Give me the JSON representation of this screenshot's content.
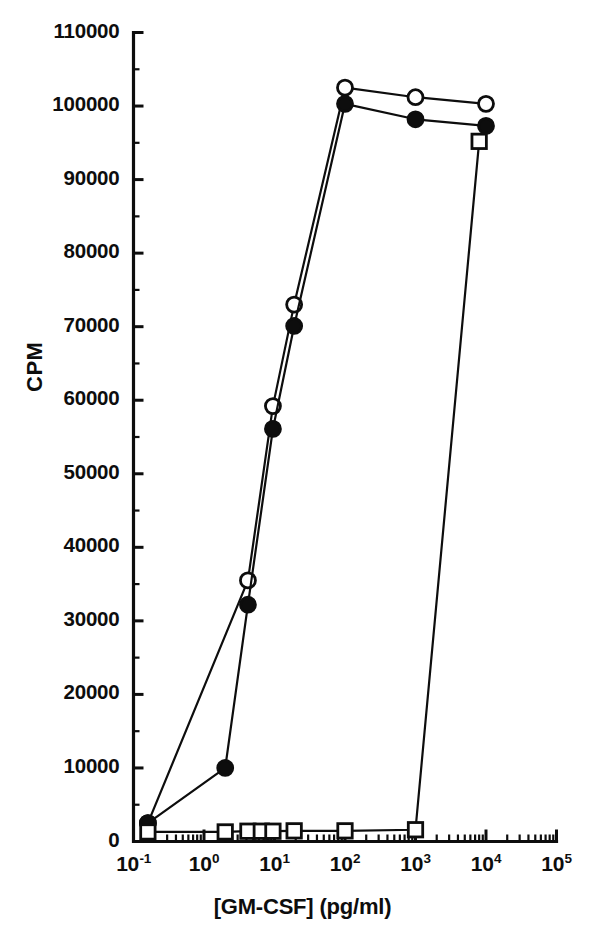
{
  "chart_data": {
    "type": "line",
    "title": "",
    "subtitle": "",
    "xlabel": "[GM-CSF] (pg/ml)",
    "ylabel": "CPM",
    "x_scale": "log",
    "y_scale": "linear",
    "xlim": [
      0.1,
      100000
    ],
    "ylim": [
      0,
      110000
    ],
    "grid": false,
    "legend": "none",
    "x_tick_labels": [
      "10-1",
      "100",
      "101",
      "102",
      "103",
      "104",
      "105"
    ],
    "x_tick_mantissa": [
      "10",
      "10",
      "10",
      "10",
      "10",
      "10",
      "10"
    ],
    "x_tick_exponents": [
      "-1",
      "0",
      "1",
      "2",
      "3",
      "4",
      "5"
    ],
    "x_tick_values": [
      0.1,
      1,
      10,
      100,
      1000,
      10000,
      100000
    ],
    "y_tick_labels": [
      "0",
      "10000",
      "20000",
      "30000",
      "40000",
      "50000",
      "60000",
      "70000",
      "80000",
      "90000",
      "100000",
      "110000"
    ],
    "y_tick_values": [
      0,
      10000,
      20000,
      30000,
      40000,
      50000,
      60000,
      70000,
      80000,
      90000,
      100000,
      110000
    ],
    "y_minor_step": 5000,
    "series": [
      {
        "name": "open-circle-series",
        "marker": "open-circle",
        "color": "#0d0d0d",
        "x": [
          0.16,
          4.2,
          9.5,
          19,
          100,
          1000,
          10000
        ],
        "y": [
          2500,
          35500,
          59200,
          73000,
          102500,
          101200,
          100300
        ]
      },
      {
        "name": "filled-circle-series",
        "marker": "filled-circle",
        "color": "#0d0d0d",
        "x": [
          0.16,
          2.0,
          4.2,
          9.5,
          19,
          100,
          1000,
          10000
        ],
        "y": [
          2500,
          10000,
          32200,
          56100,
          70100,
          100300,
          98200,
          97300
        ]
      },
      {
        "name": "open-square-series",
        "marker": "open-square",
        "color": "#0d0d0d",
        "x": [
          0.16,
          2.0,
          4.2,
          6.5,
          9.5,
          19,
          100,
          1000,
          8000
        ],
        "y": [
          1300,
          1300,
          1400,
          1400,
          1400,
          1450,
          1450,
          1600,
          95200
        ]
      }
    ]
  },
  "axes": {
    "y_axis_title": "CPM",
    "x_axis_title": "[GM-CSF] (pg/ml)"
  }
}
